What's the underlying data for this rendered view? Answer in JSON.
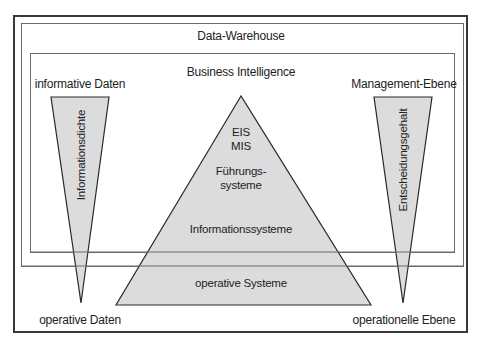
{
  "diagram": {
    "outer_frame": {
      "title": "Data-Warehouse"
    },
    "inner_frame": {
      "title": "Business Intelligence"
    },
    "left_wedge": {
      "top_label": "informative Daten",
      "vertical_label": "Informationsdichte",
      "bottom_label": "operative Daten"
    },
    "right_wedge": {
      "top_label": "Management-Ebene",
      "vertical_label": "Entscheidungsgehalt",
      "bottom_label": "operationelle Ebene"
    },
    "pyramid": {
      "levels": [
        {
          "line1": "EIS",
          "line2": "MIS"
        },
        {
          "line1": "Führungs-",
          "line2": "systeme"
        },
        {
          "line1": "Informationssysteme"
        },
        {
          "line1": "operative Systeme"
        }
      ]
    },
    "colors": {
      "fill": "#dcdcdc",
      "stroke": "#2a2a2a",
      "frame": "#6a6a6a"
    }
  }
}
